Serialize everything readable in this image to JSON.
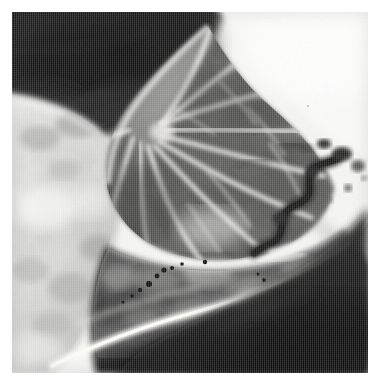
{
  "figure": {
    "kind": "grayscale-specimen-radiograph",
    "title": "Specimen radiograph",
    "width_px": 376,
    "height_px": 385,
    "background_color": "#ffffff",
    "margin_px": 12,
    "photo": {
      "x": 12,
      "y": 12,
      "width": 356,
      "height": 361,
      "tone_range": {
        "darkest": "#090909",
        "lightest": "#fafafa"
      },
      "has_caption_text": false,
      "has_scale_bar": false,
      "has_labels": false,
      "has_axes": false
    },
    "regions": [
      {
        "name": "upper-left-dark-field",
        "description": "large very dark soft-tissue / background field occupying the upper left quadrant",
        "tone": "#121212"
      },
      {
        "name": "upper-right-bright-field",
        "description": "near-white background field occupying the upper right corner",
        "tone": "#f7f7f7"
      },
      {
        "name": "radiating-fan-structure",
        "description": "central fan of bright radiating septa separating darker wedge-shaped lobules, apex toward upper-left-centre",
        "tone": "#6a6a6a"
      },
      {
        "name": "serpentine-dark-band",
        "description": "dark zig-zag serpentine structure on the right side of the field",
        "tone": "#1f1f1f"
      },
      {
        "name": "mottled-pale-tissue",
        "description": "mottled pale grey tissue along the left and lower-left margin",
        "tone": "#d5d5d5"
      },
      {
        "name": "bright-cortical-rim",
        "description": "bright curved band sweeping from lower-left to the right margin separating the mottled mass from the dark lower field",
        "tone": "#f0efe9"
      },
      {
        "name": "lower-dark-mass",
        "description": "dark mottled mass beneath the bright rim with small punctate opacities",
        "tone": "#2b2b2b"
      },
      {
        "name": "lower-right-dark-field",
        "description": "deep black field occupying the lower-right corner",
        "tone": "#0d0d0d"
      }
    ],
    "punctate_opacities": [
      {
        "cx": 137,
        "cy": 272,
        "r": 3.0
      },
      {
        "cx": 145,
        "cy": 264,
        "r": 2.4
      },
      {
        "cx": 152,
        "cy": 258,
        "r": 2.6
      },
      {
        "cx": 160,
        "cy": 256,
        "r": 2.0
      },
      {
        "cx": 128,
        "cy": 278,
        "r": 2.2
      },
      {
        "cx": 120,
        "cy": 284,
        "r": 1.8
      },
      {
        "cx": 170,
        "cy": 252,
        "r": 1.8
      },
      {
        "cx": 193,
        "cy": 250,
        "r": 2.2
      },
      {
        "cx": 111,
        "cy": 290,
        "r": 1.6
      },
      {
        "cx": 252,
        "cy": 268,
        "r": 1.9
      },
      {
        "cx": 246,
        "cy": 262,
        "r": 1.5
      }
    ]
  }
}
